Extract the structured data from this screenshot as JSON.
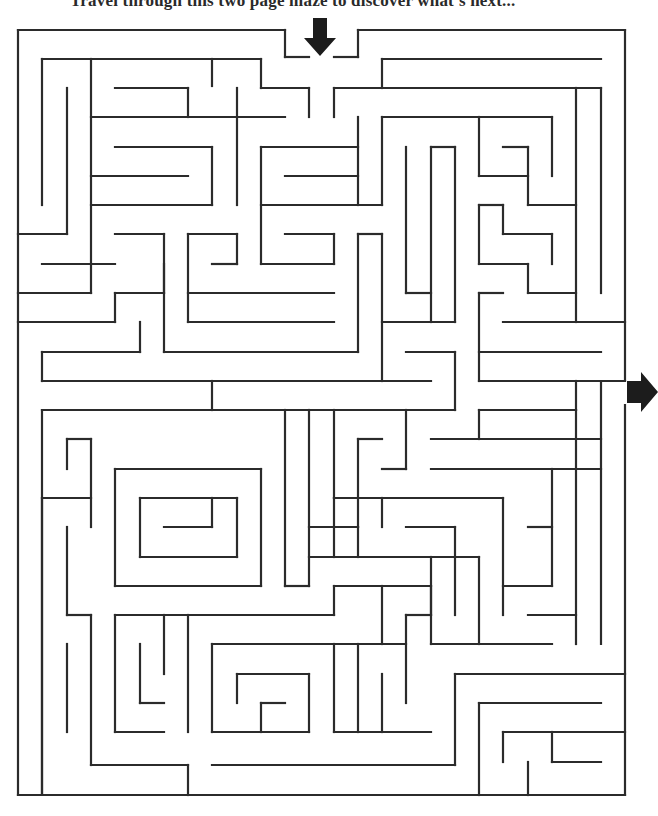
{
  "page": {
    "instructions": "Travel through this two page maze to discover what's next..."
  },
  "maze": {
    "wall_color": "#2b2b2b",
    "entrance_arrow": {
      "direction": "down",
      "x": 320,
      "y": 22
    },
    "exit_arrow": {
      "direction": "right",
      "x": 627,
      "y": 390
    },
    "walls": [
      [
        18,
        30,
        285,
        30
      ],
      [
        285,
        30,
        285,
        57
      ],
      [
        285,
        57,
        309,
        57
      ],
      [
        334,
        57,
        358,
        57
      ],
      [
        358,
        57,
        358,
        30
      ],
      [
        358,
        30,
        625,
        30
      ],
      [
        625,
        30,
        625,
        380
      ],
      [
        18,
        30,
        18,
        795
      ],
      [
        18,
        795,
        625,
        795
      ],
      [
        625,
        405,
        625,
        795
      ],
      [
        42,
        59,
        261,
        59
      ],
      [
        42,
        59,
        42,
        205
      ],
      [
        67,
        88,
        67,
        234
      ],
      [
        91,
        59,
        91,
        293
      ],
      [
        212,
        59,
        212,
        86
      ],
      [
        261,
        59,
        261,
        88
      ],
      [
        261,
        88,
        309,
        88
      ],
      [
        309,
        88,
        309,
        117
      ],
      [
        237,
        88,
        237,
        205
      ],
      [
        115,
        88,
        188,
        88
      ],
      [
        188,
        88,
        188,
        117
      ],
      [
        91,
        117,
        285,
        117
      ],
      [
        334,
        88,
        334,
        117
      ],
      [
        334,
        88,
        601,
        88
      ],
      [
        382,
        59,
        601,
        59
      ],
      [
        382,
        59,
        382,
        88
      ],
      [
        115,
        147,
        212,
        147
      ],
      [
        212,
        147,
        212,
        205
      ],
      [
        91,
        176,
        188,
        176
      ],
      [
        91,
        205,
        212,
        205
      ],
      [
        261,
        147,
        358,
        147
      ],
      [
        261,
        147,
        261,
        264
      ],
      [
        285,
        176,
        358,
        176
      ],
      [
        358,
        117,
        358,
        205
      ],
      [
        261,
        205,
        382,
        205
      ],
      [
        382,
        117,
        382,
        205
      ],
      [
        382,
        117,
        552,
        117
      ],
      [
        576,
        88,
        576,
        322
      ],
      [
        601,
        88,
        601,
        293
      ],
      [
        18,
        234,
        67,
        234
      ],
      [
        115,
        234,
        164,
        234
      ],
      [
        164,
        234,
        164,
        293
      ],
      [
        42,
        264,
        115,
        264
      ],
      [
        18,
        293,
        91,
        293
      ],
      [
        115,
        293,
        164,
        293
      ],
      [
        115,
        293,
        115,
        322
      ],
      [
        18,
        322,
        115,
        322
      ],
      [
        188,
        234,
        188,
        322
      ],
      [
        188,
        234,
        237,
        234
      ],
      [
        237,
        234,
        237,
        264
      ],
      [
        212,
        264,
        237,
        264
      ],
      [
        188,
        293,
        334,
        293
      ],
      [
        261,
        264,
        334,
        264
      ],
      [
        334,
        234,
        334,
        264
      ],
      [
        285,
        234,
        334,
        234
      ],
      [
        164,
        264,
        164,
        352
      ],
      [
        164,
        352,
        358,
        352
      ],
      [
        188,
        322,
        334,
        322
      ],
      [
        358,
        234,
        358,
        352
      ],
      [
        358,
        234,
        382,
        234
      ],
      [
        382,
        234,
        382,
        381
      ],
      [
        406,
        147,
        406,
        293
      ],
      [
        406,
        293,
        431,
        293
      ],
      [
        431,
        147,
        455,
        147
      ],
      [
        431,
        147,
        431,
        322
      ],
      [
        455,
        147,
        455,
        322
      ],
      [
        382,
        322,
        455,
        322
      ],
      [
        479,
        117,
        479,
        176
      ],
      [
        479,
        176,
        528,
        176
      ],
      [
        503,
        147,
        528,
        147
      ],
      [
        528,
        147,
        528,
        205
      ],
      [
        528,
        205,
        576,
        205
      ],
      [
        552,
        117,
        552,
        176
      ],
      [
        479,
        205,
        503,
        205
      ],
      [
        503,
        205,
        503,
        234
      ],
      [
        503,
        234,
        552,
        234
      ],
      [
        552,
        234,
        552,
        264
      ],
      [
        479,
        205,
        479,
        264
      ],
      [
        479,
        264,
        528,
        264
      ],
      [
        528,
        264,
        528,
        293
      ],
      [
        528,
        293,
        576,
        293
      ],
      [
        479,
        293,
        503,
        293
      ],
      [
        479,
        293,
        479,
        381
      ],
      [
        503,
        322,
        625,
        322
      ],
      [
        479,
        352,
        601,
        352
      ],
      [
        479,
        381,
        625,
        381
      ],
      [
        140,
        322,
        140,
        352
      ],
      [
        42,
        352,
        140,
        352
      ],
      [
        42,
        352,
        42,
        381
      ],
      [
        42,
        381,
        431,
        381
      ],
      [
        406,
        352,
        455,
        352
      ],
      [
        455,
        352,
        455,
        410
      ],
      [
        212,
        381,
        212,
        410
      ],
      [
        42,
        410,
        455,
        410
      ],
      [
        42,
        410,
        42,
        795
      ],
      [
        67,
        439,
        91,
        439
      ],
      [
        67,
        439,
        67,
        469
      ],
      [
        91,
        439,
        91,
        527
      ],
      [
        42,
        498,
        91,
        498
      ],
      [
        115,
        469,
        261,
        469
      ],
      [
        115,
        469,
        115,
        586
      ],
      [
        140,
        498,
        237,
        498
      ],
      [
        140,
        498,
        140,
        557
      ],
      [
        164,
        527,
        212,
        527
      ],
      [
        212,
        498,
        212,
        527
      ],
      [
        140,
        557,
        237,
        557
      ],
      [
        237,
        498,
        237,
        557
      ],
      [
        115,
        586,
        261,
        586
      ],
      [
        261,
        469,
        261,
        586
      ],
      [
        285,
        410,
        285,
        586
      ],
      [
        285,
        586,
        309,
        586
      ],
      [
        309,
        410,
        309,
        586
      ],
      [
        334,
        410,
        334,
        498
      ],
      [
        358,
        439,
        382,
        439
      ],
      [
        309,
        527,
        358,
        527
      ],
      [
        358,
        439,
        358,
        527
      ],
      [
        382,
        469,
        406,
        469
      ],
      [
        406,
        410,
        406,
        469
      ],
      [
        431,
        439,
        601,
        439
      ],
      [
        431,
        469,
        601,
        469
      ],
      [
        479,
        410,
        479,
        439
      ],
      [
        479,
        410,
        576,
        410
      ],
      [
        576,
        381,
        576,
        410
      ],
      [
        334,
        498,
        503,
        498
      ],
      [
        334,
        498,
        334,
        557
      ],
      [
        309,
        557,
        479,
        557
      ],
      [
        382,
        498,
        382,
        527
      ],
      [
        406,
        527,
        455,
        527
      ],
      [
        455,
        527,
        455,
        557
      ],
      [
        358,
        527,
        358,
        557
      ],
      [
        601,
        381,
        601,
        644
      ],
      [
        576,
        410,
        576,
        644
      ],
      [
        42,
        498,
        42,
        795
      ],
      [
        67,
        527,
        67,
        615
      ],
      [
        67,
        615,
        91,
        615
      ],
      [
        91,
        615,
        91,
        765
      ],
      [
        91,
        765,
        188,
        765
      ],
      [
        188,
        765,
        188,
        795
      ],
      [
        67,
        644,
        67,
        732
      ],
      [
        115,
        615,
        115,
        732
      ],
      [
        115,
        615,
        334,
        615
      ],
      [
        140,
        644,
        140,
        703
      ],
      [
        140,
        703,
        164,
        703
      ],
      [
        164,
        615,
        164,
        674
      ],
      [
        115,
        732,
        164,
        732
      ],
      [
        188,
        615,
        188,
        732
      ],
      [
        212,
        644,
        212,
        732
      ],
      [
        212,
        644,
        406,
        644
      ],
      [
        237,
        674,
        309,
        674
      ],
      [
        237,
        674,
        237,
        703
      ],
      [
        261,
        703,
        285,
        703
      ],
      [
        261,
        703,
        261,
        732
      ],
      [
        212,
        732,
        309,
        732
      ],
      [
        309,
        674,
        309,
        732
      ],
      [
        334,
        586,
        334,
        615
      ],
      [
        334,
        586,
        431,
        586
      ],
      [
        431,
        586,
        431,
        615
      ],
      [
        382,
        586,
        382,
        644
      ],
      [
        406,
        615,
        431,
        615
      ],
      [
        406,
        615,
        406,
        703
      ],
      [
        358,
        644,
        358,
        732
      ],
      [
        334,
        644,
        334,
        732
      ],
      [
        334,
        732,
        431,
        732
      ],
      [
        382,
        674,
        382,
        732
      ],
      [
        431,
        557,
        431,
        644
      ],
      [
        431,
        644,
        552,
        644
      ],
      [
        455,
        557,
        455,
        615
      ],
      [
        479,
        557,
        479,
        644
      ],
      [
        503,
        498,
        503,
        615
      ],
      [
        528,
        527,
        552,
        527
      ],
      [
        552,
        469,
        552,
        586
      ],
      [
        503,
        586,
        552,
        586
      ],
      [
        528,
        615,
        576,
        615
      ],
      [
        212,
        765,
        455,
        765
      ],
      [
        455,
        674,
        455,
        765
      ],
      [
        455,
        674,
        625,
        674
      ],
      [
        479,
        703,
        601,
        703
      ],
      [
        479,
        703,
        479,
        795
      ],
      [
        503,
        732,
        503,
        762
      ],
      [
        503,
        732,
        625,
        732
      ],
      [
        528,
        762,
        528,
        795
      ],
      [
        552,
        732,
        552,
        762
      ],
      [
        552,
        762,
        601,
        762
      ]
    ]
  }
}
